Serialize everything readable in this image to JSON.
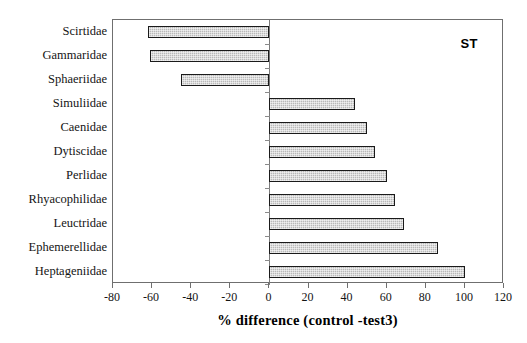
{
  "chart_data": {
    "type": "bar",
    "orientation": "horizontal",
    "title": "",
    "panel_label": "ST",
    "xlabel": "% difference (control -test3)",
    "ylabel": "",
    "xlim": [
      -80,
      120
    ],
    "xticks": [
      -80,
      -60,
      -40,
      -20,
      0,
      20,
      40,
      60,
      80,
      100,
      120
    ],
    "xtick_labels": [
      "-80",
      "-60",
      "-40",
      "-20",
      "0",
      "20",
      "40",
      "60",
      "80",
      "100",
      "120"
    ],
    "grid": false,
    "legend": null,
    "categories": [
      "Scirtidae",
      "Gammaridae",
      "Sphaeriidae",
      "Simuliidae",
      "Caenidae",
      "Dytiscidae",
      "Perlidae",
      "Rhyacophilidae",
      "Leuctridae",
      "Ephemerellidae",
      "Heptageniidae"
    ],
    "values": [
      -62,
      -61,
      -45,
      44,
      50,
      54,
      60,
      64,
      69,
      86,
      100
    ],
    "bar_fill_color": "#b9b9b9",
    "bar_edge_color": "#1a1a1a",
    "axis_color": "#6f6f6f"
  }
}
